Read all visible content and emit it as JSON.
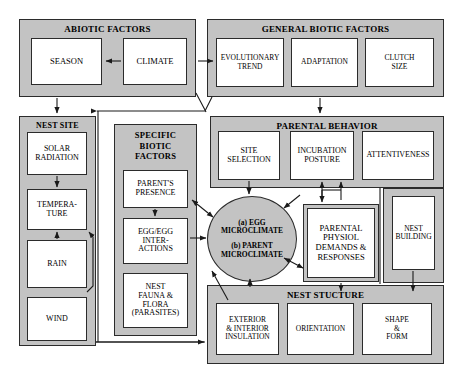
{
  "diagram": {
    "colors": {
      "panel_fill": "#c3c3c3",
      "box_fill": "#ffffff",
      "stroke": "#1a1a1a",
      "background": "#ffffff"
    }
  },
  "groups": {
    "abiotic": {
      "title": "ABIOTIC FACTORS",
      "items": [
        {
          "label": "SEASON"
        },
        {
          "label": "CLIMATE"
        }
      ]
    },
    "general_biotic": {
      "title": "GENERAL BIOTIC FACTORS",
      "items": [
        {
          "label": "EVOLUTIONARY\nTREND",
          "line1": "EVOLUTIONARY",
          "line2": "TREND"
        },
        {
          "label": "ADAPTATION",
          "line1": "ADAPTATION",
          "line2": ""
        },
        {
          "label": "CLUTCH\nSIZE",
          "line1": "CLUTCH",
          "line2": "SIZE"
        }
      ]
    },
    "nest_site": {
      "title": "NEST SITE",
      "items": [
        {
          "line1": "SOLAR",
          "line2": "RADIATION"
        },
        {
          "line1": "TEMPERA-",
          "line2": "TURE"
        },
        {
          "line1": "RAIN",
          "line2": ""
        },
        {
          "line1": "WIND",
          "line2": ""
        }
      ]
    },
    "specific_biotic": {
      "title_line1": "SPECIFIC",
      "title_line2": "BIOTIC",
      "title_line3": "FACTORS",
      "items": [
        {
          "line1": "PARENT'S",
          "line2": "PRESENCE",
          "line3": "",
          "line4": ""
        },
        {
          "line1": "EGG/EGG",
          "line2": "INTER-",
          "line3": "ACTIONS",
          "line4": ""
        },
        {
          "line1": "NEST",
          "line2": "FAUNA &",
          "line3": "FLORA",
          "line4": "(PARASITES)"
        }
      ]
    },
    "parental_behavior": {
      "title": "PARENTAL BEHAVIOR",
      "items": [
        {
          "line1": "SITE",
          "line2": "SELECTION"
        },
        {
          "line1": "INCUBATION",
          "line2": "POSTURE"
        },
        {
          "line1": "ATTENTIVENESS",
          "line2": ""
        }
      ],
      "nest_building": {
        "line1": "NEST",
        "line2": "BUILDING"
      },
      "parental_physiol": {
        "line1": "PARENTAL",
        "line2": "PHYSIOL",
        "line3": "DEMANDS &",
        "line4": "RESPONSES"
      }
    },
    "nest_structure": {
      "title": "NEST STUCTURE",
      "items": [
        {
          "line1": "EXTERIOR",
          "line2": "& INTERIOR",
          "line3": "INSULATION"
        },
        {
          "line1": "ORIENTATION",
          "line2": "",
          "line3": ""
        },
        {
          "line1": "SHAPE",
          "line2": "&",
          "line3": "FORM"
        }
      ]
    }
  },
  "center_node": {
    "line1": "(a) EGG",
    "line2": "MICROCLIMATE",
    "line3": "(b) PARENT",
    "line4": "MICROCLIMATE"
  }
}
